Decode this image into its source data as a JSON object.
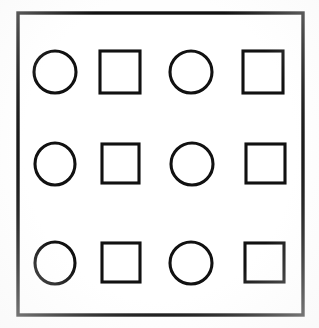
{
  "figure": {
    "background_color": "#fefefe",
    "stroke_color": "#111111",
    "frame": {
      "label": "outer-frame",
      "x": 18,
      "y": 13,
      "width": 285,
      "height": 302,
      "stroke_width": 3.4,
      "fill": "#ffffff"
    },
    "grid": {
      "rows": 3,
      "columns": 4,
      "pattern": [
        "circle",
        "square",
        "circle",
        "square"
      ]
    },
    "shapes": [
      {
        "name": "circle-r1-c1",
        "type": "circle",
        "row": 1,
        "column": 1,
        "cx": 55,
        "cy": 72,
        "rx": 21,
        "ry": 21,
        "stroke_width": 3.1
      },
      {
        "name": "square-r1-c2",
        "type": "square",
        "row": 1,
        "column": 2,
        "x": 100,
        "y": 51,
        "width": 40,
        "height": 42,
        "stroke_width": 3.1
      },
      {
        "name": "circle-r1-c3",
        "type": "circle",
        "row": 1,
        "column": 3,
        "cx": 191,
        "cy": 72,
        "rx": 21,
        "ry": 21,
        "stroke_width": 3.1
      },
      {
        "name": "square-r1-c4",
        "type": "square",
        "row": 1,
        "column": 4,
        "x": 243,
        "y": 51,
        "width": 40,
        "height": 42,
        "stroke_width": 3.1
      },
      {
        "name": "circle-r2-c1",
        "type": "circle",
        "row": 2,
        "column": 1,
        "cx": 55,
        "cy": 164,
        "rx": 20,
        "ry": 21,
        "stroke_width": 3.1
      },
      {
        "name": "square-r2-c2",
        "type": "square",
        "row": 2,
        "column": 2,
        "x": 102,
        "y": 144,
        "width": 37,
        "height": 39,
        "stroke_width": 3.1
      },
      {
        "name": "circle-r2-c3",
        "type": "circle",
        "row": 2,
        "column": 3,
        "cx": 192,
        "cy": 164,
        "rx": 21,
        "ry": 21,
        "stroke_width": 3.1
      },
      {
        "name": "square-r2-c4",
        "type": "square",
        "row": 2,
        "column": 4,
        "x": 246,
        "y": 144,
        "width": 39,
        "height": 39,
        "stroke_width": 3.1
      },
      {
        "name": "circle-r3-c1",
        "type": "circle",
        "row": 3,
        "column": 1,
        "cx": 55,
        "cy": 263,
        "rx": 20,
        "ry": 21,
        "stroke_width": 3.1
      },
      {
        "name": "square-r3-c2",
        "type": "square",
        "row": 3,
        "column": 2,
        "x": 102,
        "y": 243,
        "width": 38,
        "height": 39,
        "stroke_width": 3.1
      },
      {
        "name": "circle-r3-c3",
        "type": "circle",
        "row": 3,
        "column": 3,
        "cx": 191,
        "cy": 263,
        "rx": 21,
        "ry": 21,
        "stroke_width": 3.1
      },
      {
        "name": "square-r3-c4",
        "type": "square",
        "row": 3,
        "column": 4,
        "x": 245,
        "y": 243,
        "width": 39,
        "height": 39,
        "stroke_width": 3.1
      }
    ]
  }
}
